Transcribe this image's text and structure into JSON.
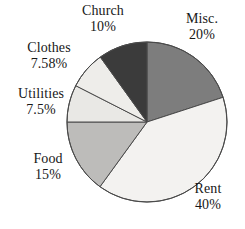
{
  "chart_data": {
    "type": "pie",
    "title": "",
    "subtitle": "",
    "xlabel": "",
    "ylabel": "",
    "legend_position": "none",
    "grid": false,
    "labels_outside": true,
    "start_angle_deg": 0,
    "direction": "clockwise",
    "categories": [
      "Misc.",
      "Rent",
      "Food",
      "Utilities",
      "Clothes",
      "Church"
    ],
    "values": [
      20,
      40,
      15,
      7.5,
      7.58,
      10
    ],
    "value_texts": [
      "20%",
      "40%",
      "15%",
      "7.5%",
      "7.58%",
      "10%"
    ],
    "colors": [
      "#7d7d7d",
      "#f3f2f0",
      "#bdbcba",
      "#e9e8e5",
      "#eeedea",
      "#3b3b3b"
    ],
    "slices": [
      {
        "name": "Misc.",
        "percent": 20,
        "percent_text": "20%",
        "color": "#7d7d7d",
        "start_deg": 0,
        "end_deg": 72
      },
      {
        "name": "Rent",
        "percent": 40,
        "percent_text": "40%",
        "color": "#f3f2f0",
        "start_deg": 72,
        "end_deg": 216
      },
      {
        "name": "Food",
        "percent": 15,
        "percent_text": "15%",
        "color": "#bdbcba",
        "start_deg": 216,
        "end_deg": 270
      },
      {
        "name": "Utilities",
        "percent": 7.5,
        "percent_text": "7.5%",
        "color": "#e9e8e5",
        "start_deg": 270,
        "end_deg": 297
      },
      {
        "name": "Clothes",
        "percent": 7.58,
        "percent_text": "7.58%",
        "color": "#eeedea",
        "start_deg": 297,
        "end_deg": 324.288
      },
      {
        "name": "Church",
        "percent": 10,
        "percent_text": "10%",
        "color": "#3b3b3b",
        "start_deg": 324.288,
        "end_deg": 360
      }
    ]
  },
  "labels": {
    "church": {
      "name": "Church",
      "value": "10%"
    },
    "misc": {
      "name": "Misc.",
      "value": "20%"
    },
    "clothes": {
      "name": "Clothes",
      "value": "7.58%"
    },
    "utilities": {
      "name": "Utilities",
      "value": "7.5%"
    },
    "food": {
      "name": "Food",
      "value": "15%"
    },
    "rent": {
      "name": "Rent",
      "value": "40%"
    }
  },
  "style": {
    "outline_color": "#4a4a4a",
    "background": "#ffffff",
    "text_color": "#171717"
  }
}
